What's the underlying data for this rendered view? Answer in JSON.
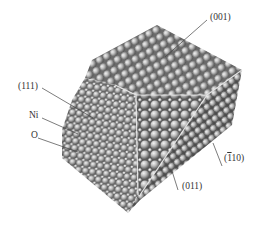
{
  "figure": {
    "labels": [
      {
        "id": "facet-001",
        "text": "(001)",
        "x": 210,
        "y": 13
      },
      {
        "id": "facet-111",
        "text": "(111)",
        "x": 20,
        "y": 82
      },
      {
        "id": "atom-ni",
        "text": "Ni",
        "x": 29,
        "y": 113
      },
      {
        "id": "atom-o",
        "text": "O",
        "x": 31,
        "y": 133
      },
      {
        "id": "facet-110bar",
        "text": "110",
        "prefix": "(",
        "bar": "1",
        "suffix": ")",
        "x": 226,
        "y": 155
      },
      {
        "id": "facet-011",
        "text": "(011)",
        "x": 182,
        "y": 182
      }
    ],
    "colors": {
      "atom_large": "#b8b8b8",
      "atom_small": "#d8d8d8",
      "atom_shadow": "#555555",
      "edge_lines": "#e8e8e8",
      "leader_lines": "#444444",
      "background": "#ffffff"
    }
  }
}
